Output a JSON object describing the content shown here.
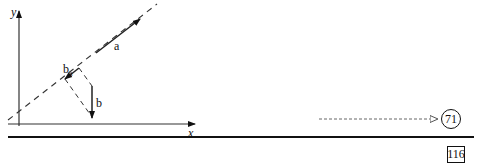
{
  "figure": {
    "axis_x_label": "x",
    "axis_y_label": "y",
    "vector_a_label": "a",
    "vector_b_label": "b",
    "projection_label": "b",
    "projection_subscript": "a"
  },
  "footer": {
    "reference_number": "71",
    "page_number": "116"
  }
}
